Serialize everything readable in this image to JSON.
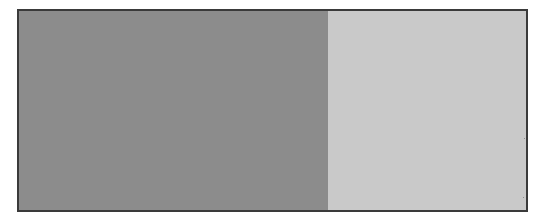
{
  "figure": {
    "kind": "geometric-tiling-morph",
    "background_color": "#ffffff",
    "frame": {
      "x": 17,
      "y": 9,
      "width": 511,
      "height": 203,
      "border_color": "#3a3a3a",
      "border_width": 2
    },
    "colors": {
      "tile_fill": "#8c8c8c",
      "gap_fill": "#c9c9c9",
      "frame_border": "#3a3a3a",
      "page_background": "#ffffff"
    }
  },
  "chart_data": {
    "type": "heatmap",
    "title": "",
    "xlabel": "",
    "ylabel": "",
    "lattice": {
      "type": "hexagonal",
      "column_spacing": 60.5,
      "row_spacing": 52.4,
      "row_offset_fraction": 0.5,
      "columns": 9,
      "rows": 5
    },
    "morph": {
      "parameter_name": "t",
      "parameter_range": [
        0,
        1
      ],
      "direction": "left-to-right",
      "stages": [
        {
          "t": 0.0,
          "label": "circle packing",
          "tile_radius_fraction": 0.47,
          "corner_softness": 1.0,
          "rotation_deg": 0,
          "inverted": false
        },
        {
          "t": 0.25,
          "label": "expanded circles",
          "tile_radius_fraction": 0.53,
          "corner_softness": 0.8,
          "rotation_deg": 0,
          "inverted": false
        },
        {
          "t": 0.5,
          "label": "hexagons with triangular gaps",
          "tile_radius_fraction": 0.58,
          "corner_softness": 0.1,
          "rotation_deg": 0,
          "inverted": false
        },
        {
          "t": 0.72,
          "label": "pinwheel stars",
          "tile_radius_fraction": 0.55,
          "corner_softness": 0.25,
          "rotation_deg": 18,
          "inverted": true
        },
        {
          "t": 1.0,
          "label": "light hexagons on dark",
          "tile_radius_fraction": 0.46,
          "corner_softness": 0.05,
          "rotation_deg": 30,
          "inverted": true
        }
      ]
    },
    "series": [
      {
        "name": "tile_fill_coverage",
        "x": [
          0,
          0.25,
          0.5,
          0.72,
          1.0
        ],
        "values": [
          0.86,
          0.9,
          0.84,
          0.6,
          0.52
        ]
      }
    ]
  }
}
